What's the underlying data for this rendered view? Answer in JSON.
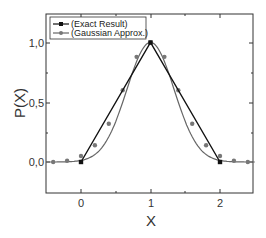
{
  "chart_data": {
    "type": "line",
    "title": "",
    "xlabel": "X",
    "ylabel": "P(X)",
    "xlim": [
      -0.5,
      2.5
    ],
    "ylim": [
      -0.2,
      1.2
    ],
    "x_ticks": [
      "0",
      "1",
      "2"
    ],
    "y_ticks": [
      "0,0",
      "0,5",
      "1,0"
    ],
    "grid": false,
    "legend_position": "upper left",
    "series": [
      {
        "name": "(Exact Result)",
        "color": "#111111",
        "marker": "square",
        "x": [
          0,
          1,
          2
        ],
        "y": [
          0.0,
          1.0,
          0.0
        ]
      },
      {
        "name": "(Gaussian Approx.)",
        "color": "#666666",
        "marker": "circle",
        "x": [
          -0.4,
          -0.2,
          0.0,
          0.2,
          0.4,
          0.6,
          0.8,
          1.0,
          1.2,
          1.4,
          1.6,
          1.8,
          2.0,
          2.2,
          2.4
        ],
        "y": [
          0.0,
          0.01,
          0.05,
          0.14,
          0.32,
          0.6,
          0.88,
          1.0,
          0.88,
          0.6,
          0.32,
          0.14,
          0.05,
          0.01,
          0.0
        ]
      }
    ]
  },
  "legend": {
    "items": [
      "(Exact Result)",
      "(Gaussian Approx.)"
    ]
  },
  "axes": {
    "x_label": "X",
    "y_label": "P(X)",
    "x_ticks": [
      "0",
      "1",
      "2"
    ],
    "y_ticks": [
      "0,0",
      "0,5",
      "1,0"
    ]
  }
}
